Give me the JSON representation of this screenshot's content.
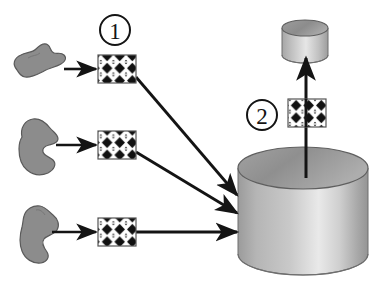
{
  "diagram": {
    "background_color": "#ffffff",
    "stroke_color": "#141414",
    "blob_fill": "#8c8c8c",
    "blob_stroke": "#4a4a4a",
    "filter_fill": "#ffffff",
    "filter_pattern_color": "#111111",
    "cylinder_light": "#eeeeee",
    "cylinder_mid": "#b4b4b4",
    "cylinder_dark": "#8e8e8e",
    "cylinder_top_fill": "#9a9a9a"
  },
  "markers": [
    {
      "id": "marker-1",
      "label": "1",
      "name": "step-marker-one",
      "cx": 115,
      "cy": 30,
      "r": 15
    },
    {
      "id": "marker-2",
      "label": "2",
      "name": "step-marker-two",
      "cx": 262,
      "cy": 115,
      "r": 15
    }
  ],
  "sources": [
    {
      "id": "source-1",
      "name": "source-blob-top",
      "label": "",
      "cx": 38,
      "cy": 62
    },
    {
      "id": "source-2",
      "name": "source-blob-middle",
      "label": "",
      "cx": 38,
      "cy": 148
    },
    {
      "id": "source-3",
      "name": "source-blob-bottom",
      "label": "",
      "cx": 38,
      "cy": 232
    }
  ],
  "filters": [
    {
      "id": "filter-1",
      "name": "filter-box-top",
      "label": "",
      "x": 98,
      "y": 55,
      "width": 38,
      "height": 28
    },
    {
      "id": "filter-2",
      "name": "filter-box-middle",
      "label": "",
      "x": 98,
      "y": 131,
      "width": 38,
      "height": 28
    },
    {
      "id": "filter-3",
      "name": "filter-box-bottom",
      "label": "",
      "x": 98,
      "y": 218,
      "width": 38,
      "height": 28
    },
    {
      "id": "filter-4",
      "name": "filter-box-extract",
      "label": "",
      "x": 288,
      "y": 99,
      "width": 38,
      "height": 28
    }
  ],
  "stores": [
    {
      "id": "store-main",
      "name": "data-store-cylinder",
      "label": "",
      "cx": 303,
      "top_y": 168,
      "rx": 65,
      "ry": 21,
      "body_height": 86
    },
    {
      "id": "store-output",
      "name": "output-cylinder",
      "label": "",
      "cx": 305,
      "top_y": 28,
      "rx": 23,
      "ry": 8,
      "body_height": 27
    }
  ],
  "arrows": [
    {
      "id": "arrow-1",
      "name": "arrow-source-one-to-filter",
      "x1": 68,
      "y1": 69,
      "x2": 95,
      "y2": 69
    },
    {
      "id": "arrow-2",
      "name": "arrow-source-two-to-filter",
      "x1": 68,
      "y1": 145,
      "x2": 95,
      "y2": 145
    },
    {
      "id": "arrow-3",
      "name": "arrow-source-three-to-filter",
      "x1": 68,
      "y1": 232,
      "x2": 95,
      "y2": 232
    },
    {
      "id": "arrow-4",
      "name": "arrow-filter-one-to-store",
      "x1": 137,
      "y1": 78,
      "x2": 237,
      "y2": 194
    },
    {
      "id": "arrow-5",
      "name": "arrow-filter-two-to-store",
      "x1": 137,
      "y1": 152,
      "x2": 237,
      "y2": 212
    },
    {
      "id": "arrow-6",
      "name": "arrow-filter-three-to-store",
      "x1": 137,
      "y1": 232,
      "x2": 237,
      "y2": 232
    },
    {
      "id": "arrow-7",
      "name": "arrow-store-to-output",
      "x1": 306,
      "y1": 176,
      "x2": 306,
      "y2": 58
    }
  ]
}
